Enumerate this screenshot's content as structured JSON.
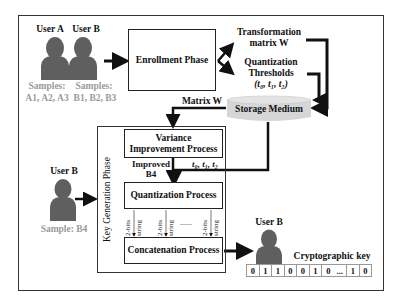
{
  "users": {
    "user_a": {
      "label": "User A",
      "samples_label": "Samples:",
      "samples": "A1, A2, A3"
    },
    "user_b_enroll": {
      "label": "User B",
      "samples_label": "Samples:",
      "samples": "B1, B2, B3"
    },
    "user_b_keygen": {
      "label": "User B",
      "sample": "Sample: B4"
    },
    "user_b_output": {
      "label": "User B"
    }
  },
  "enrollment": {
    "label": "Enrollment Phase"
  },
  "outputs": {
    "transformation": {
      "line1": "Transformation",
      "line2": "matrix W"
    },
    "thresholds": {
      "line1": "Quantization",
      "line2": "Thresholds",
      "line3": "(t₀, t₁, t₂)"
    }
  },
  "storage": {
    "label": "Storage Medium"
  },
  "matrix_label": "Matrix W",
  "key_generation": {
    "phase_label": "Key Generation Phase",
    "variance": {
      "line1": "Variance",
      "line2": "Improvement Process"
    },
    "improved_label": {
      "line1": "Improved",
      "line2": "B4"
    },
    "thresholds_label": "t₀, t₁, t₂",
    "quantization": {
      "label": "Quantization Process"
    },
    "bit_strings": [
      {
        "a": "2-bits",
        "b": "string"
      },
      {
        "a": "2-bits",
        "b": "string"
      },
      {
        "a": "2-bits",
        "b": "string"
      }
    ],
    "ellipsis": "......",
    "concatenation": {
      "label": "Concatenation Process"
    }
  },
  "crypto_key": {
    "label": "Cryptographic key",
    "bits": [
      "0",
      "1",
      "1",
      "0",
      "0",
      "1",
      "0",
      "...",
      "1",
      "0"
    ]
  },
  "colors": {
    "user_icon": "#5f5f5f",
    "sample_text": "#9a9a9a",
    "storage_fill": "#d6d6d6",
    "line": "#111111"
  }
}
